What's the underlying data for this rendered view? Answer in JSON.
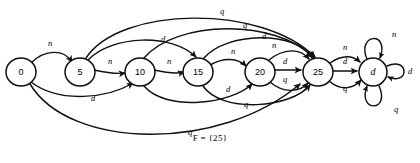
{
  "diagram": {
    "caption": "F = {25}",
    "stroke_color": "#111111",
    "node_fill": "#ffffff",
    "background": "#ffffff"
  },
  "alphabet": {
    "nickel": "n",
    "dime": "d",
    "quarter": "q"
  },
  "nodes": [
    {
      "id": "s0",
      "label": "0",
      "cx": 21,
      "cy": 72,
      "rx": 15,
      "ry": 14,
      "italic": false
    },
    {
      "id": "s5",
      "label": "5",
      "cx": 80,
      "cy": 72,
      "rx": 15,
      "ry": 14,
      "italic": false
    },
    {
      "id": "s10",
      "label": "10",
      "cx": 140,
      "cy": 72,
      "rx": 15,
      "ry": 14,
      "italic": false
    },
    {
      "id": "s15",
      "label": "15",
      "cx": 198,
      "cy": 72,
      "rx": 15,
      "ry": 14,
      "italic": false
    },
    {
      "id": "s20",
      "label": "20",
      "cx": 260,
      "cy": 72,
      "rx": 15,
      "ry": 14,
      "italic": false
    },
    {
      "id": "s25",
      "label": "25",
      "cx": 318,
      "cy": 72,
      "rx": 15,
      "ry": 14,
      "italic": false
    },
    {
      "id": "sd",
      "label": "d",
      "cx": 373,
      "cy": 72,
      "rx": 14,
      "ry": 14,
      "italic": true
    }
  ],
  "edges": [
    {
      "id": "e-0-5-n",
      "from": "s0",
      "to": "s5",
      "label": "n",
      "lx": 50,
      "ly": 44
    },
    {
      "id": "e-5-10-n",
      "from": "s5",
      "to": "s10",
      "label": "n",
      "lx": 110,
      "ly": 62
    },
    {
      "id": "e-10-15-n",
      "from": "s10",
      "to": "s15",
      "label": "n",
      "lx": 169,
      "ly": 62
    },
    {
      "id": "e-15-20-n",
      "from": "s15",
      "to": "s20",
      "label": "n",
      "lx": 233,
      "ly": 52
    },
    {
      "id": "e-20-25-n",
      "from": "s20",
      "to": "s25",
      "label": "n",
      "lx": 274,
      "ly": 46
    },
    {
      "id": "e-20-25-d",
      "from": "s20",
      "to": "s25",
      "label": "d",
      "lx": 285,
      "ly": 62
    },
    {
      "id": "e-20-25-q",
      "from": "s20",
      "to": "s25",
      "label": "q",
      "lx": 285,
      "ly": 80
    },
    {
      "id": "e-0-10-d",
      "from": "s0",
      "to": "s10",
      "label": "d",
      "lx": 93,
      "ly": 99
    },
    {
      "id": "e-5-15-d",
      "from": "s5",
      "to": "s15",
      "label": "d",
      "lx": 163,
      "ly": 40
    },
    {
      "id": "e-10-20-d",
      "from": "s10",
      "to": "s20",
      "label": "d",
      "lx": 228,
      "ly": 90
    },
    {
      "id": "e-15-25-d",
      "from": "s15",
      "to": "s25",
      "label": "d",
      "lx": 264,
      "ly": 37
    },
    {
      "id": "e-0-25-q",
      "from": "s0",
      "to": "s25",
      "label": "q",
      "lx": 190,
      "ly": 133
    },
    {
      "id": "e-5-25-q",
      "from": "s5",
      "to": "s25",
      "label": "q",
      "lx": 222,
      "ly": 12
    },
    {
      "id": "e-10-25-q",
      "from": "s10",
      "to": "s25",
      "label": "q",
      "lx": 245,
      "ly": 26
    },
    {
      "id": "e-15-25-q",
      "from": "s15",
      "to": "s25",
      "label": "q",
      "lx": 246,
      "ly": 105
    },
    {
      "id": "e-25-d-n",
      "from": "s25",
      "to": "sd",
      "label": "n",
      "lx": 345,
      "ly": 48
    },
    {
      "id": "e-25-d-d",
      "from": "s25",
      "to": "sd",
      "label": "d",
      "lx": 345,
      "ly": 62
    },
    {
      "id": "e-25-d-q",
      "from": "s25",
      "to": "sd",
      "label": "q",
      "lx": 345,
      "ly": 89
    },
    {
      "id": "e-d-self-n",
      "from": "sd",
      "to": "sd",
      "label": "n",
      "lx": 394,
      "ly": 35
    },
    {
      "id": "e-d-self-d",
      "from": "sd",
      "to": "sd",
      "label": "d",
      "lx": 410,
      "ly": 72
    },
    {
      "id": "e-d-self-q",
      "from": "sd",
      "to": "sd",
      "label": "q",
      "lx": 396,
      "ly": 110
    }
  ]
}
